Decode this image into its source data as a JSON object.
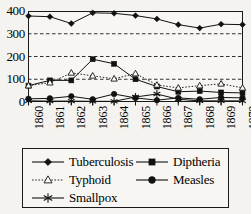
{
  "chart_data": {
    "type": "line",
    "title": "",
    "subtitle": "",
    "xlabel": "",
    "ylabel": "",
    "categories": [
      "1860",
      "1861",
      "1862",
      "1863",
      "1864",
      "1865",
      "1866",
      "1867",
      "1868",
      "1869",
      "1870"
    ],
    "x": [
      1860,
      1861,
      1862,
      1863,
      1864,
      1865,
      1866,
      1867,
      1868,
      1869,
      1870
    ],
    "xlim": [
      1860,
      1870
    ],
    "ylim": [
      0,
      400
    ],
    "yticks": [
      0,
      100,
      200,
      300,
      400
    ],
    "ytick_labels": [
      "0",
      "100",
      "200",
      "300",
      "400"
    ],
    "grid": "horizontal-dashed",
    "legend_position": "below-plot",
    "series": [
      {
        "name": "Tuberculosis",
        "marker": "filled-diamond",
        "line": "solid",
        "color": "#111111",
        "values": [
          378,
          375,
          345,
          392,
          390,
          380,
          365,
          340,
          325,
          342,
          340
        ]
      },
      {
        "name": "Diptheria",
        "marker": "filled-square",
        "line": "solid",
        "color": "#111111",
        "values": [
          72,
          95,
          95,
          188,
          168,
          100,
          68,
          45,
          48,
          42,
          40
        ]
      },
      {
        "name": "Typhoid",
        "marker": "open-triangle",
        "line": "dotted",
        "color": "#111111",
        "values": [
          72,
          85,
          128,
          115,
          102,
          125,
          75,
          62,
          72,
          80,
          62
        ]
      },
      {
        "name": "Measles",
        "marker": "filled-circle",
        "line": "solid",
        "color": "#111111",
        "values": [
          14,
          16,
          25,
          12,
          35,
          18,
          8,
          18,
          12,
          20,
          18
        ]
      },
      {
        "name": "Smallpox",
        "marker": "asterisk",
        "line": "solid",
        "color": "#111111",
        "values": [
          5,
          4,
          4,
          3,
          3,
          22,
          35,
          12,
          5,
          5,
          5
        ]
      }
    ]
  },
  "legend": {
    "entries": [
      {
        "label": "Tuberculosis",
        "marker": "filled-diamond",
        "line": "solid"
      },
      {
        "label": "Diptheria",
        "marker": "filled-square",
        "line": "solid"
      },
      {
        "label": "Typhoid",
        "marker": "open-triangle",
        "line": "dotted"
      },
      {
        "label": "Measles",
        "marker": "filled-circle",
        "line": "solid"
      },
      {
        "label": "Smallpox",
        "marker": "asterisk",
        "line": "solid"
      }
    ]
  }
}
